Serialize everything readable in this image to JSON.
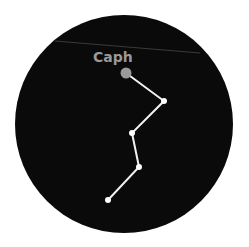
{
  "constellation": {
    "background_color": "#0a0a0a",
    "line_color": "#f2f2f2",
    "star_color": "#ffffff",
    "highlight_color": "#9a9a9a",
    "circle": {
      "cx": 124,
      "cy": 124,
      "r": 109
    },
    "faint_line": {
      "x1": 55,
      "y1": 41,
      "x2": 200,
      "y2": 53,
      "color": "#3a3a3a"
    },
    "highlight_star": {
      "name": "Caph",
      "x": 126,
      "y": 73,
      "r": 5.5
    },
    "label": {
      "text": "Caph",
      "x": 93,
      "y": 62,
      "color": "#9a9a9a"
    },
    "stars": [
      {
        "x": 126,
        "y": 73
      },
      {
        "x": 164,
        "y": 101
      },
      {
        "x": 132,
        "y": 133
      },
      {
        "x": 139,
        "y": 167
      },
      {
        "x": 108,
        "y": 200
      }
    ]
  }
}
